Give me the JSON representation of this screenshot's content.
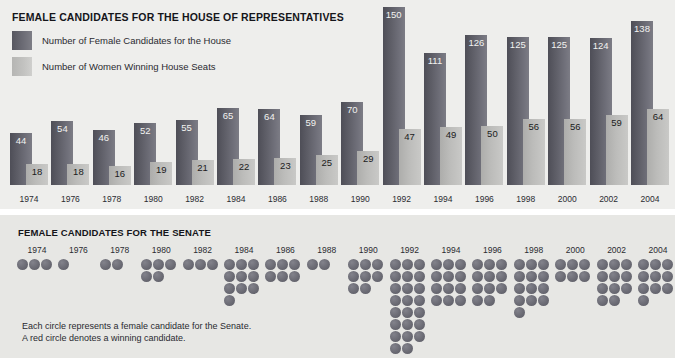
{
  "house": {
    "title": "FEMALE CANDIDATES FOR THE HOUSE OF REPRESENTATIVES",
    "legend": [
      {
        "key": "candidates",
        "label": "Number of Female Candidates for the House",
        "color": "#6c6c75"
      },
      {
        "key": "winners",
        "label": "Number of Women Winning House Seats",
        "color": "#c3c3c1"
      }
    ]
  },
  "senate": {
    "title": "FEMALE CANDIDATES FOR THE SENATE",
    "note_line1": "Each circle represents a female candidate for the Senate.",
    "note_line2": "A red circle denotes a winning candidate.",
    "candidate_color": "#6b6b74",
    "winner_color": "#8a4a4a"
  },
  "chart_data": [
    {
      "type": "bar",
      "title": "FEMALE CANDIDATES FOR THE HOUSE OF REPRESENTATIVES",
      "xlabel": "",
      "ylabel": "",
      "ylim": [
        0,
        150
      ],
      "grid": false,
      "legend_position": "top-left",
      "categories": [
        "1974",
        "1976",
        "1978",
        "1980",
        "1982",
        "1984",
        "1986",
        "1988",
        "1990",
        "1992",
        "1994",
        "1996",
        "1998",
        "2000",
        "2002",
        "2004"
      ],
      "series": [
        {
          "name": "Number of Female Candidates for the House",
          "values": [
            44,
            54,
            46,
            52,
            55,
            65,
            64,
            59,
            70,
            150,
            111,
            126,
            125,
            125,
            124,
            138
          ]
        },
        {
          "name": "Number of Women Winning House Seats",
          "values": [
            18,
            18,
            16,
            19,
            21,
            22,
            23,
            25,
            29,
            47,
            49,
            50,
            56,
            56,
            59,
            64
          ]
        }
      ]
    },
    {
      "type": "bar",
      "title": "FEMALE CANDIDATES FOR THE SENATE",
      "xlabel": "",
      "ylabel": "Number of female Senate candidates (one circle = one candidate)",
      "grid": false,
      "categories": [
        "1974",
        "1976",
        "1978",
        "1980",
        "1982",
        "1984",
        "1986",
        "1988",
        "1990",
        "1992",
        "1994",
        "1996",
        "1998",
        "2000",
        "2002",
        "2004"
      ],
      "values": [
        3,
        1,
        2,
        5,
        3,
        10,
        6,
        2,
        8,
        23,
        12,
        11,
        13,
        6,
        11,
        10
      ],
      "winners": [
        0,
        0,
        0,
        0,
        0,
        0,
        0,
        0,
        0,
        0,
        0,
        0,
        0,
        0,
        0,
        0
      ]
    }
  ]
}
